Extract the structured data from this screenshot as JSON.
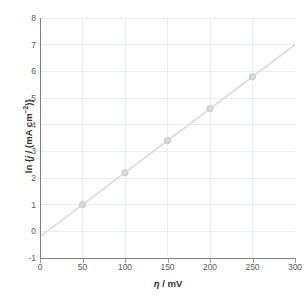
{
  "chart_data": {
    "type": "scatter",
    "title": "",
    "subtitle": "",
    "xlabel": "η / mV",
    "ylabel": "ln {j / (mA cm⁻²)}",
    "xlabel_parts": {
      "symbol": "η",
      "rest": " / mV"
    },
    "ylabel_parts": {
      "prefix": "ln {",
      "symbol": "j",
      "mid": " / (mA cm",
      "exp": "−2",
      "suffix": ")}"
    },
    "xlim": [
      0,
      300
    ],
    "ylim": [
      -1,
      8
    ],
    "xticks": [
      0,
      50,
      100,
      150,
      200,
      250,
      300
    ],
    "yticks": [
      -1,
      0,
      1,
      2,
      3,
      4,
      5,
      6,
      7,
      8
    ],
    "xtick_labels": [
      "0",
      "50",
      "100",
      "150",
      "200",
      "250",
      "300"
    ],
    "ytick_labels": [
      "-1",
      "0",
      "1",
      "2",
      "3",
      "4",
      "5",
      "6",
      "7",
      "8"
    ],
    "grid": true,
    "grid_axes": "both",
    "legend": "none",
    "x": [
      50,
      100,
      150,
      200,
      250
    ],
    "values": [
      1.0,
      2.2,
      3.4,
      4.6,
      5.8
    ],
    "points": [
      {
        "x": 50,
        "y": 1.0
      },
      {
        "x": 100,
        "y": 2.2
      },
      {
        "x": 150,
        "y": 3.4
      },
      {
        "x": 200,
        "y": 4.6
      },
      {
        "x": 250,
        "y": 5.8
      }
    ],
    "trendline": {
      "type": "linear",
      "slope": 0.024,
      "intercept": -0.2,
      "x_start": 0,
      "x_end": 300,
      "y_start": -0.2,
      "y_end": 7.0
    },
    "style": {
      "line_color": "#d9d9d9",
      "marker_color": "#d9d9d9",
      "marker_edge_color": "#c9c9c9",
      "marker_shape": "circle",
      "marker_size": 5,
      "grid_color": "#e8eef4",
      "axis_color": "#808080",
      "tick_label_color": "#595959",
      "axis_title_color": "#333333",
      "background": "#ffffff"
    }
  }
}
